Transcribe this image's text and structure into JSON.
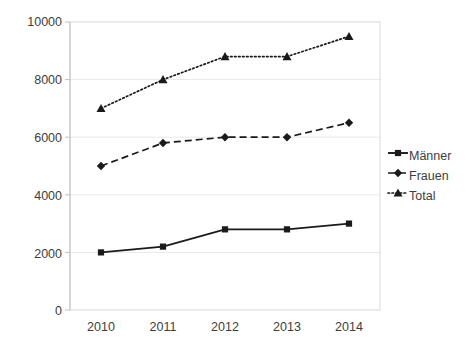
{
  "chart_data": {
    "type": "line",
    "title": "",
    "subtitle": "",
    "xlabel": "",
    "ylabel": "",
    "categories": [
      "2010",
      "2011",
      "2012",
      "2013",
      "2014"
    ],
    "x": [
      2010,
      2011,
      2012,
      2013,
      2014
    ],
    "series": [
      {
        "name": "Männer",
        "values": [
          2000,
          2200,
          2800,
          2800,
          3000
        ],
        "line_style": "solid",
        "marker": "square",
        "color": "#1a1a1a"
      },
      {
        "name": "Frauen",
        "values": [
          5000,
          5800,
          6000,
          6000,
          6500
        ],
        "line_style": "dashed",
        "marker": "diamond",
        "color": "#1a1a1a"
      },
      {
        "name": "Total",
        "values": [
          7000,
          8000,
          8800,
          8800,
          9500
        ],
        "line_style": "dotted",
        "marker": "triangle",
        "color": "#1a1a1a"
      }
    ],
    "ylim": [
      0,
      10000
    ],
    "y_ticks": [
      0,
      2000,
      4000,
      6000,
      8000,
      10000
    ],
    "y_tick_labels": [
      "0",
      "2000",
      "4000",
      "6000",
      "8000",
      "10000"
    ],
    "x_tick_labels": [
      "2010",
      "2011",
      "2012",
      "2013",
      "2014"
    ],
    "grid": {
      "horizontal": true,
      "vertical": false,
      "color": "#e8e8e8"
    },
    "legend": {
      "position": "right",
      "entries": [
        "Männer",
        "Frauen",
        "Total"
      ]
    },
    "colors": {
      "series": "#1a1a1a",
      "grid": "#e8e8e8",
      "axis": "#bfbfbf",
      "text": "#3d3d3d",
      "background": "#ffffff"
    }
  },
  "axis": {
    "y_labels": [
      "10000",
      "8000",
      "6000",
      "4000",
      "2000",
      "0"
    ],
    "x_labels": [
      "2010",
      "2011",
      "2012",
      "2013",
      "2014"
    ]
  },
  "legend": {
    "items": [
      {
        "label": "Männer"
      },
      {
        "label": "Frauen"
      },
      {
        "label": "Total"
      }
    ]
  }
}
